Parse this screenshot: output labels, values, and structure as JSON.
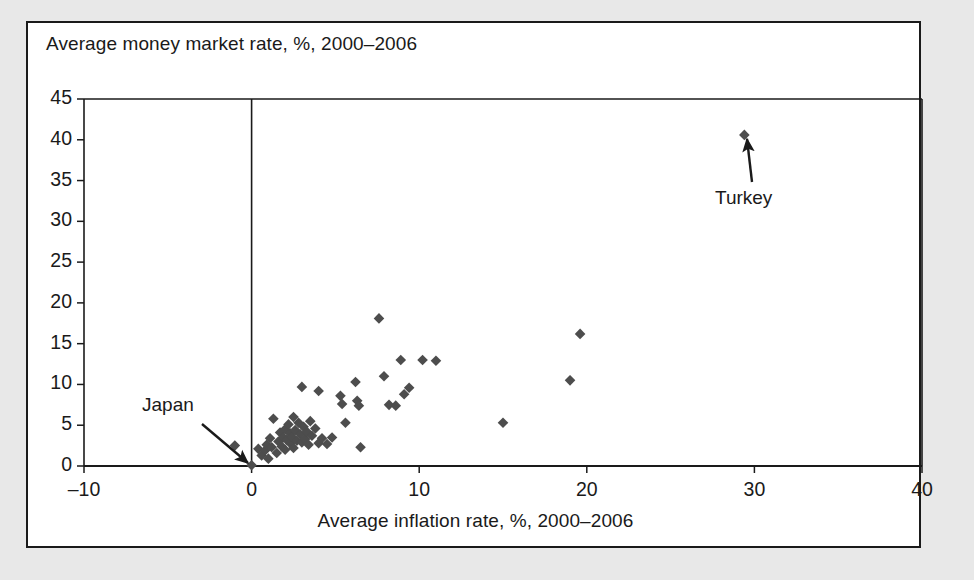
{
  "figure": {
    "panel_background": "#ffffff",
    "outer_background": "#e8e8e8",
    "border_color": "#1a1a1a"
  },
  "chart_data": {
    "type": "scatter",
    "title": "",
    "ylabel": "Average money market rate, %, 2000–2006",
    "xlabel": "Average inflation rate, %, 2000–2006",
    "xlim": [
      -10,
      40
    ],
    "ylim": [
      0,
      45
    ],
    "xticks": [
      -10,
      0,
      10,
      20,
      30,
      40
    ],
    "xtick_labels": [
      "–10",
      "0",
      "10",
      "20",
      "30",
      "40"
    ],
    "yticks": [
      0,
      5,
      10,
      15,
      20,
      25,
      30,
      35,
      40,
      45
    ],
    "ytick_labels": [
      "0",
      "5",
      "10",
      "15",
      "20",
      "25",
      "30",
      "35",
      "40",
      "45"
    ],
    "grid": false,
    "legend": "none",
    "marker": "diamond",
    "marker_color": "#4d4d4d",
    "marker_size": 9,
    "zero_line_x": 0,
    "points": [
      [
        -1.0,
        2.5
      ],
      [
        0.0,
        0.1
      ],
      [
        0.4,
        2.1
      ],
      [
        0.6,
        1.3
      ],
      [
        0.8,
        1.9
      ],
      [
        0.9,
        2.6
      ],
      [
        1.0,
        0.9
      ],
      [
        1.1,
        3.4
      ],
      [
        1.2,
        2.3
      ],
      [
        1.3,
        5.8
      ],
      [
        1.5,
        1.6
      ],
      [
        1.6,
        3.0
      ],
      [
        1.7,
        4.1
      ],
      [
        1.8,
        2.4
      ],
      [
        1.9,
        3.5
      ],
      [
        2.0,
        4.5
      ],
      [
        2.0,
        2.0
      ],
      [
        2.1,
        3.2
      ],
      [
        2.2,
        5.1
      ],
      [
        2.3,
        2.8
      ],
      [
        2.3,
        4.0
      ],
      [
        2.4,
        3.6
      ],
      [
        2.5,
        6.0
      ],
      [
        2.5,
        2.2
      ],
      [
        2.6,
        4.4
      ],
      [
        2.7,
        3.1
      ],
      [
        2.8,
        5.3
      ],
      [
        2.9,
        3.9
      ],
      [
        3.0,
        9.7
      ],
      [
        3.0,
        2.9
      ],
      [
        3.1,
        4.8
      ],
      [
        3.2,
        3.3
      ],
      [
        3.3,
        4.2
      ],
      [
        3.4,
        2.6
      ],
      [
        3.5,
        5.5
      ],
      [
        3.6,
        3.7
      ],
      [
        3.8,
        4.6
      ],
      [
        4.0,
        9.2
      ],
      [
        4.0,
        2.8
      ],
      [
        4.2,
        3.4
      ],
      [
        4.5,
        2.7
      ],
      [
        4.8,
        3.5
      ],
      [
        5.3,
        8.6
      ],
      [
        5.4,
        7.6
      ],
      [
        5.6,
        5.3
      ],
      [
        6.2,
        10.3
      ],
      [
        6.3,
        8.0
      ],
      [
        6.4,
        7.4
      ],
      [
        6.5,
        2.3
      ],
      [
        7.6,
        18.1
      ],
      [
        7.9,
        11.0
      ],
      [
        8.2,
        7.5
      ],
      [
        8.6,
        7.4
      ],
      [
        8.9,
        13.0
      ],
      [
        9.1,
        8.8
      ],
      [
        9.4,
        9.6
      ],
      [
        10.2,
        13.0
      ],
      [
        11.0,
        12.9
      ],
      [
        15.0,
        5.3
      ],
      [
        19.0,
        10.5
      ],
      [
        19.6,
        16.2
      ],
      [
        29.4,
        40.6
      ]
    ],
    "annotations": [
      {
        "label": "Japan",
        "label_x": 140,
        "label_y": 392,
        "arrow_from": [
          200,
          422
        ],
        "arrow_to": [
          246,
          461
        ],
        "target_point": [
          0.0,
          0.1
        ]
      },
      {
        "label": "Turkey",
        "label_x": 713,
        "label_y": 185,
        "arrow_from": [
          750,
          180
        ],
        "arrow_to": [
          745,
          137
        ],
        "target_point": [
          29.4,
          40.6
        ]
      }
    ]
  }
}
